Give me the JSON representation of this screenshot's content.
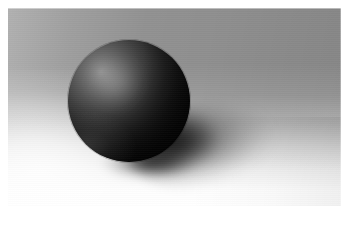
{
  "image": {
    "kind": "3d-render",
    "subject": "sphere",
    "caption": "Rendered grey sphere resting on a ground plane with a soft cast shadow",
    "width_px": 349,
    "height_px": 229
  },
  "frame": {
    "left_px": 8,
    "top_px": 8,
    "width_px": 333,
    "height_px": 198,
    "border_color": "#ffffff"
  },
  "palette": {
    "page_background": "#ffffff",
    "backdrop_gray": "#8f8f8f",
    "backdrop_light_gray": "#b4b4b4",
    "ground_white": "#ffffff",
    "sphere_light": "#8d8d8d",
    "sphere_mid": "#4a4a4a",
    "sphere_dark": "#0a0a0a",
    "shadow_black": "#000000"
  },
  "scene": {
    "sphere": {
      "label": "sphere",
      "center_x_px": 129,
      "center_y_px": 101,
      "radius_px": 61,
      "highlight_x_pct": 27,
      "highlight_y_pct": 26
    },
    "cast_shadow": {
      "label": "cast shadow",
      "direction": "lower-right",
      "angle_deg": -7,
      "extent_x_px": 320
    },
    "ground": {
      "label": "ground plane",
      "horizon_y_px": 120,
      "lighting": "bright foreground falling off to grey backdrop"
    },
    "light": {
      "label": "key light",
      "direction": "upper-left"
    }
  }
}
